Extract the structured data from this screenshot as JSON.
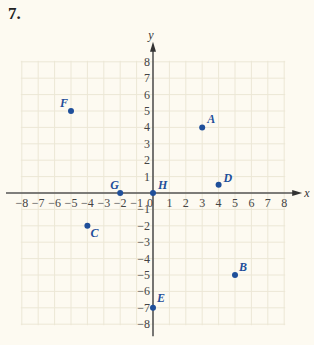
{
  "problem_number": "7.",
  "chart_data": {
    "type": "scatter",
    "title": "",
    "xlabel": "x",
    "ylabel": "y",
    "xlim": [
      -8,
      8
    ],
    "ylim": [
      -8,
      8
    ],
    "grid": true,
    "x_ticks": [
      -8,
      -7,
      -6,
      -5,
      -4,
      -3,
      -2,
      -1,
      0,
      1,
      2,
      3,
      4,
      5,
      6,
      7,
      8
    ],
    "y_ticks": [
      -8,
      -7,
      -6,
      -5,
      -4,
      -3,
      -2,
      -1,
      1,
      2,
      3,
      4,
      5,
      6,
      7,
      8
    ],
    "points": [
      {
        "label": "A",
        "x": 3,
        "y": 4
      },
      {
        "label": "B",
        "x": 5,
        "y": -5
      },
      {
        "label": "C",
        "x": -4,
        "y": -2
      },
      {
        "label": "D",
        "x": 4,
        "y": 0.5
      },
      {
        "label": "E",
        "x": 0,
        "y": -7
      },
      {
        "label": "F",
        "x": -5,
        "y": 5
      },
      {
        "label": "G",
        "x": -2,
        "y": 0
      },
      {
        "label": "H",
        "x": 0,
        "y": 0
      }
    ],
    "colors": {
      "point": "#1f4f9a",
      "grid": "#ece7d6",
      "axis": "#555555",
      "background": "#fdfaf1"
    }
  }
}
